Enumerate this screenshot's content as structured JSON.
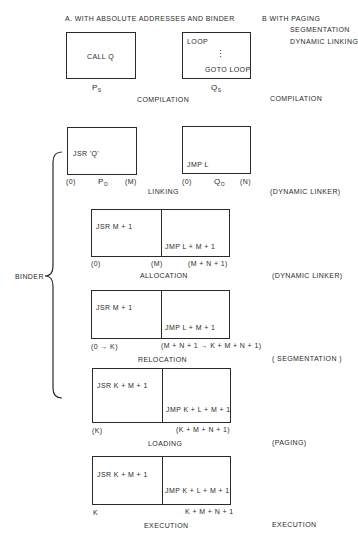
{
  "header": {
    "left_title": "A. WITH ABSOLUTE ADDRESSES AND BINDER",
    "right_title_line1": "B WITH PAGING",
    "right_title_line2": "SEGMENTATION",
    "right_title_line3": "DYNAMIC LINKING"
  },
  "compilation": {
    "p_box_text": "CALL Q",
    "q_box_line1": "LOOP",
    "q_box_dots": "⋮",
    "q_box_line2": "GOTO  LOOP",
    "p_label": "P",
    "p_sub": "S",
    "q_label": "Q",
    "q_sub": "S",
    "stage_label": "COMPILATION",
    "right_label": "COMPILATION"
  },
  "linking": {
    "p_box_text": "JSR  'Q'",
    "q_box_text": "JMP L",
    "p_start": "(0)",
    "p_label": "P",
    "p_sub": "O",
    "p_end": "(M)",
    "q_start": "(0)",
    "q_label": "Q",
    "q_sub": "O",
    "q_end": "(N)",
    "stage_label": "LINKING",
    "right_label": "(DYNAMIC LINKER)"
  },
  "allocation": {
    "left_text": "JSR  M + 1",
    "right_text": "JMP  L + M + 1",
    "start": "(0)",
    "mid": "(M)",
    "end": "(M + N + 1)",
    "stage_label": "ALLOCATION",
    "right_label": "(DYNAMIC LINKER)"
  },
  "relocation": {
    "left_text": "JSR  M + 1",
    "right_text": "JMP  L + M + 1",
    "start": "(0 → K)",
    "end": "(M + N + 1 → K + M + N + 1)",
    "stage_label": "RELOCATION",
    "right_label": "( SEGMENTATION )"
  },
  "loading": {
    "left_text": "JSR  K + M + 1",
    "right_text": "JMP  K + L + M + 1",
    "start": "(K)",
    "end": "(K + M + N + 1)",
    "stage_label": "LOADING",
    "right_label": "(PAGING)"
  },
  "execution": {
    "left_text": "JSR   K + M + 1",
    "right_text": "JMP  K + L + M + 1",
    "start": "K",
    "end": "K + M + N + 1",
    "stage_label": "EXECUTION",
    "right_label": "EXECUTION"
  },
  "binder": {
    "label": "BINDER"
  }
}
